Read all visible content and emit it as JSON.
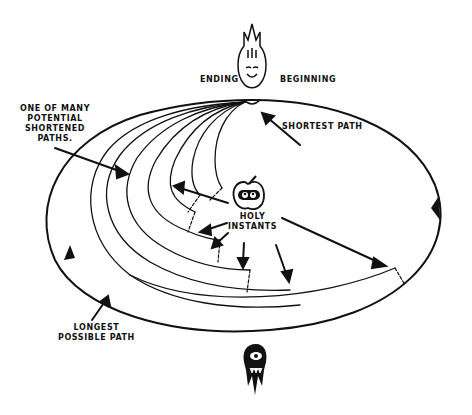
{
  "diagram": {
    "labels": {
      "ending": "ENDING",
      "beginning": "BEGINNING",
      "shortest_path": "SHORTEST PATH",
      "shortened_paths": [
        "ONE OF MANY",
        "POTENTIAL",
        "SHORTENED",
        "PATHS."
      ],
      "holy_instants": [
        "HOLY",
        "INSTANTS"
      ],
      "longest_path": [
        "LONGEST",
        "POSSIBLE PATH"
      ]
    },
    "icons": {
      "top": "flame-face-icon",
      "center": "apple-eyes-icon",
      "bottom": "one-eyed-monster-icon"
    },
    "colors": {
      "ink": "#111111",
      "background": "#ffffff"
    }
  }
}
